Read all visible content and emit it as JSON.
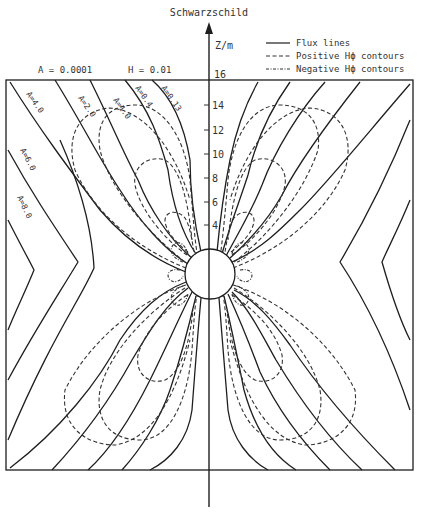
{
  "title": "Schwarzschild",
  "axis": {
    "label": "Z/m",
    "ticks": [
      "16",
      "14",
      "12",
      "10",
      "8",
      "6",
      "4"
    ]
  },
  "params": {
    "a": "A = 0.0001",
    "h": "H = 0.01"
  },
  "legend": [
    {
      "style": "solid",
      "label": "Flux lines"
    },
    {
      "style": "dashed",
      "label": "Positive Hϕ contours"
    },
    {
      "style": "dash-dot",
      "label": "Negative Hϕ contours"
    }
  ],
  "curve_labels": [
    "A=4.0",
    "A=2.0",
    "A=1.0",
    "A=0.4",
    "A=0.13",
    "A=6.0",
    "A=8.0"
  ],
  "colors": {
    "ink": "#1e1e1e",
    "background": "#ffffff"
  }
}
